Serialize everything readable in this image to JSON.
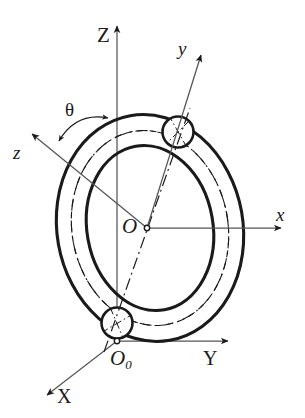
{
  "figure": {
    "background_color": "#ffffff",
    "line_color": "#1a1a1a",
    "axis_color": "#4a4a4a",
    "width": 305,
    "height": 418
  },
  "labels": {
    "global_z": "Z",
    "global_y": "Y",
    "global_x": "X",
    "body_x": "x",
    "body_y": "y",
    "body_z": "z",
    "theta": "θ",
    "center_origin": "O",
    "base_origin_main": "O",
    "base_origin_sub": "0"
  },
  "axes": {
    "global": [
      {
        "name": "Z",
        "label": "Z",
        "direction": "up",
        "origin": "O0"
      },
      {
        "name": "Y",
        "label": "Y",
        "direction": "right",
        "origin": "O0"
      },
      {
        "name": "X",
        "label": "X",
        "direction": "down-left",
        "origin": "O0"
      }
    ],
    "body": [
      {
        "name": "x",
        "label": "x",
        "direction": "right",
        "origin": "O"
      },
      {
        "name": "y",
        "label": "y",
        "direction": "up-right",
        "origin": "O"
      },
      {
        "name": "z",
        "label": "z",
        "direction": "up-left",
        "origin": "O"
      }
    ]
  },
  "annotations": {
    "angle": {
      "symbol": "θ",
      "between": [
        "z",
        "Z"
      ],
      "arc_style": "double-headed-arc"
    },
    "origins": [
      {
        "id": "O",
        "label": "O",
        "role": "torus-center"
      },
      {
        "id": "O0",
        "label": "O0",
        "role": "global-origin"
      }
    ],
    "cross_sections": [
      {
        "id": "top-circle",
        "role": "torus-tube-cross-section"
      },
      {
        "id": "bottom-circle",
        "role": "torus-tube-cross-section"
      }
    ],
    "curves": [
      {
        "id": "outer-ellipse",
        "style": "solid"
      },
      {
        "id": "inner-ellipse",
        "style": "solid"
      },
      {
        "id": "centerline-ellipse-dashed",
        "style": "dashed"
      },
      {
        "id": "centerline-ellipse-dashdot",
        "style": "dash-dot"
      },
      {
        "id": "tube-axis-dashdot",
        "style": "dash-dot"
      }
    ]
  }
}
